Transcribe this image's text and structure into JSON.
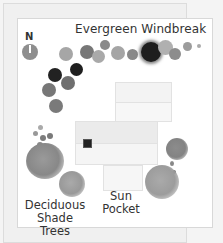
{
  "diagram": {
    "title": "Evergreen Windbreak",
    "compass": {
      "label": "N",
      "icon": "compass-north-icon"
    },
    "labels": {
      "deciduous_line1": "Deciduous",
      "deciduous_line2": "Shade Trees",
      "sun_line1": "Sun",
      "sun_line2": "Pocket"
    },
    "colors": {
      "background": "#f4f4f4",
      "card": "#ffffff",
      "tree_dark": "#1e1e1e",
      "tree_mid": "#6e6e6e",
      "tree_light": "#a8a8a8",
      "house": "#f3f3f3"
    }
  }
}
